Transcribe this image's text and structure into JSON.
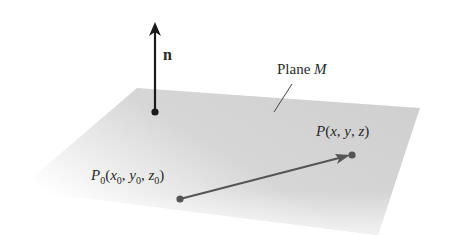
{
  "diagram": {
    "normal_vector": {
      "label": "n"
    },
    "plane": {
      "label_prefix": "Plane ",
      "label_name": "M"
    },
    "point_p": {
      "name": "P",
      "open": "(",
      "x": "x",
      "sep1": ", ",
      "y": "y",
      "sep2": ", ",
      "z": "z",
      "close": ")"
    },
    "point_p0": {
      "name": "P",
      "sub": "0",
      "open": "(",
      "x": "x",
      "sep1": ", ",
      "y": "y",
      "sep2": ", ",
      "z": "z",
      "close": ")"
    },
    "colors": {
      "plane": "#d4d4d4",
      "normal_arrow": "#1a1a1a",
      "vector_arrow": "#555555",
      "text": "#2a2a2a"
    }
  }
}
